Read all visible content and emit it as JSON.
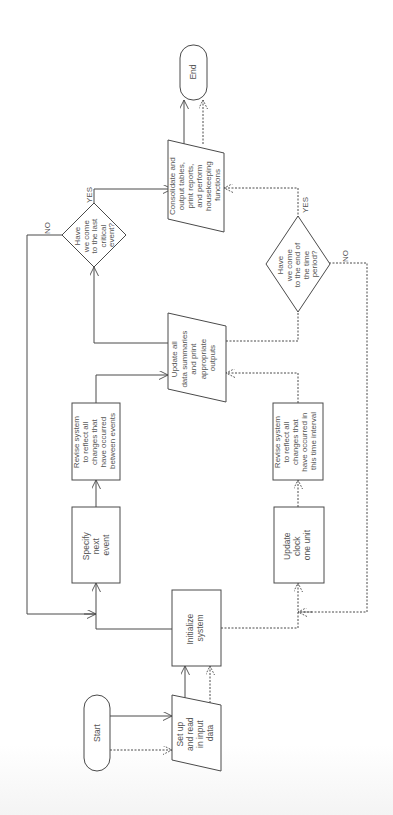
{
  "diagram": {
    "type": "flowchart",
    "orientation": "rotated-90-ccw",
    "nodes": {
      "start": {
        "shape": "terminal",
        "lines": [
          "Start"
        ]
      },
      "setup": {
        "shape": "manual-input",
        "lines": [
          "Set up",
          "and read",
          "in input",
          "data"
        ]
      },
      "initialize": {
        "shape": "process",
        "lines": [
          "Initialize",
          "system"
        ]
      },
      "specify_next_event": {
        "shape": "process",
        "lines": [
          "Specify",
          "next",
          "event"
        ]
      },
      "revise_events": {
        "shape": "process",
        "lines": [
          "Revise system",
          "to reflect all",
          "changes that",
          "have occurred",
          "between events"
        ]
      },
      "update_summaries": {
        "shape": "manual-input",
        "lines": [
          "Update all",
          "data summaries",
          "and print",
          "appropriate",
          "outputs"
        ]
      },
      "decision_last_event": {
        "shape": "decision",
        "lines": [
          "Have",
          "we come",
          "to the last",
          "critical",
          "event?"
        ]
      },
      "consolidate": {
        "shape": "manual-input",
        "lines": [
          "Consolidate and",
          "output tables,",
          "print reports,",
          "and perform",
          "housekeeping",
          "functions"
        ]
      },
      "end": {
        "shape": "terminal",
        "lines": [
          "End"
        ]
      },
      "update_clock": {
        "shape": "process",
        "lines": [
          "Update",
          "clock",
          "one unit"
        ]
      },
      "revise_interval": {
        "shape": "process",
        "lines": [
          "Revise system",
          "to reflect all",
          "changes that",
          "have occurred in",
          "this time interval"
        ]
      },
      "decision_time_period": {
        "shape": "decision",
        "lines": [
          "Have",
          "we come",
          "to the end of",
          "the time",
          "period?"
        ]
      }
    },
    "edge_labels": {
      "last_event_yes": "YES",
      "last_event_no": "NO",
      "time_period_yes": "YES",
      "time_period_no": "NO"
    },
    "edges": [
      {
        "from": "start",
        "to": "setup",
        "style": "solid"
      },
      {
        "from": "start",
        "to": "setup",
        "style": "dashed"
      },
      {
        "from": "setup",
        "to": "initialize",
        "style": "solid"
      },
      {
        "from": "setup",
        "to": "initialize",
        "style": "dashed"
      },
      {
        "from": "initialize",
        "to": "specify_next_event",
        "style": "solid"
      },
      {
        "from": "specify_next_event",
        "to": "revise_events",
        "style": "solid"
      },
      {
        "from": "revise_events",
        "to": "update_summaries",
        "style": "solid"
      },
      {
        "from": "update_summaries",
        "to": "decision_last_event",
        "style": "solid"
      },
      {
        "from": "decision_last_event",
        "to": "consolidate",
        "label": "YES",
        "style": "solid"
      },
      {
        "from": "decision_last_event",
        "to": "specify_next_event",
        "label": "NO",
        "style": "solid"
      },
      {
        "from": "consolidate",
        "to": "end",
        "style": "solid"
      },
      {
        "from": "consolidate",
        "to": "end",
        "style": "dashed"
      },
      {
        "from": "initialize",
        "to": "update_clock",
        "style": "dashed"
      },
      {
        "from": "update_clock",
        "to": "revise_interval",
        "style": "dashed"
      },
      {
        "from": "revise_interval",
        "to": "update_summaries",
        "style": "dashed"
      },
      {
        "from": "update_summaries",
        "to": "decision_time_period",
        "style": "dashed"
      },
      {
        "from": "decision_time_period",
        "to": "consolidate",
        "label": "YES",
        "style": "dashed"
      },
      {
        "from": "decision_time_period",
        "to": "update_clock",
        "label": "NO",
        "style": "dashed"
      }
    ]
  }
}
